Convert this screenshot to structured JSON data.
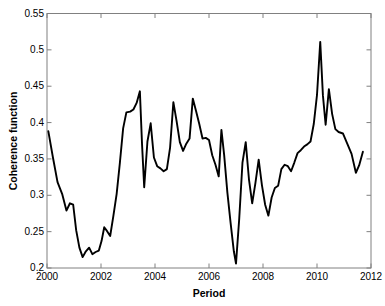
{
  "chart_data": {
    "type": "line",
    "title": "",
    "xlabel": "Period",
    "ylabel": "Coherence function",
    "xlim": [
      2000,
      2012
    ],
    "ylim": [
      0.2,
      0.55
    ],
    "xticks": [
      2000,
      2002,
      2004,
      2006,
      2008,
      2010,
      2012
    ],
    "xtick_labels": [
      "2000",
      "2002",
      "2004",
      "2006",
      "2008",
      "2010",
      "2012"
    ],
    "yticks": [
      0.2,
      0.25,
      0.3,
      0.35,
      0.4,
      0.45,
      0.5,
      0.55
    ],
    "ytick_labels": [
      "0.2",
      "0.25",
      "0.3",
      "0.35",
      "0.4",
      "0.45",
      "0.5",
      "0.55"
    ],
    "grid": false,
    "legend": null,
    "line_color": "#000000",
    "line_width": 1.9,
    "box_color": "#808080",
    "series": [
      {
        "name": "Coherence function",
        "x": [
          2000.05,
          2000.22,
          2000.39,
          2000.56,
          2000.72,
          2000.85,
          2000.97,
          2001.08,
          2001.2,
          2001.32,
          2001.44,
          2001.56,
          2001.68,
          2001.8,
          2001.92,
          2002.02,
          2002.12,
          2002.22,
          2002.34,
          2002.46,
          2002.58,
          2002.7,
          2002.82,
          2002.94,
          2003.08,
          2003.2,
          2003.32,
          2003.44,
          2003.52,
          2003.6,
          2003.72,
          2003.84,
          2003.96,
          2004.08,
          2004.2,
          2004.32,
          2004.44,
          2004.56,
          2004.68,
          2004.8,
          2004.92,
          2005.04,
          2005.16,
          2005.28,
          2005.4,
          2005.52,
          2005.64,
          2005.76,
          2005.88,
          2006.0,
          2006.12,
          2006.24,
          2006.36,
          2006.46,
          2006.56,
          2006.68,
          2006.8,
          2006.92,
          2007.0,
          2007.12,
          2007.24,
          2007.36,
          2007.48,
          2007.6,
          2007.72,
          2007.84,
          2007.96,
          2008.08,
          2008.2,
          2008.32,
          2008.44,
          2008.56,
          2008.68,
          2008.8,
          2008.92,
          2009.04,
          2009.16,
          2009.28,
          2009.4,
          2009.52,
          2009.64,
          2009.76,
          2009.88,
          2010.0,
          2010.12,
          2010.22,
          2010.32,
          2010.44,
          2010.56,
          2010.68,
          2010.8,
          2010.96,
          2011.12,
          2011.28,
          2011.44,
          2011.56,
          2011.7
        ],
        "y": [
          0.388,
          0.352,
          0.318,
          0.302,
          0.279,
          0.289,
          0.287,
          0.252,
          0.228,
          0.215,
          0.223,
          0.228,
          0.219,
          0.222,
          0.224,
          0.237,
          0.256,
          0.251,
          0.244,
          0.272,
          0.302,
          0.345,
          0.392,
          0.414,
          0.415,
          0.418,
          0.427,
          0.443,
          0.37,
          0.311,
          0.374,
          0.399,
          0.352,
          0.34,
          0.337,
          0.333,
          0.336,
          0.366,
          0.428,
          0.402,
          0.373,
          0.361,
          0.371,
          0.378,
          0.433,
          0.416,
          0.398,
          0.378,
          0.379,
          0.376,
          0.355,
          0.342,
          0.326,
          0.39,
          0.356,
          0.304,
          0.262,
          0.223,
          0.206,
          0.268,
          0.345,
          0.373,
          0.322,
          0.289,
          0.317,
          0.349,
          0.314,
          0.287,
          0.272,
          0.297,
          0.31,
          0.313,
          0.336,
          0.342,
          0.34,
          0.333,
          0.345,
          0.358,
          0.362,
          0.367,
          0.37,
          0.374,
          0.398,
          0.438,
          0.511,
          0.437,
          0.397,
          0.446,
          0.412,
          0.391,
          0.387,
          0.385,
          0.371,
          0.357,
          0.331,
          0.341,
          0.36
        ]
      }
    ]
  },
  "axes": {
    "ylabel_text": "Coherence function",
    "xlabel_text": "Period"
  }
}
